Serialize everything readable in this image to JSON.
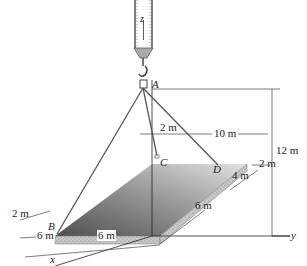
{
  "figure": {
    "points": {
      "A": "A",
      "B": "B",
      "C": "C",
      "D": "D"
    },
    "axes": {
      "x": "x",
      "y": "y",
      "z": "z"
    },
    "dimensions": {
      "height_A": "12 m",
      "c_offset": "2 m",
      "d_offset_top": "10 m",
      "d_side_2": "2 m",
      "d_side_4": "4 m",
      "right_edge_6": "6 m",
      "b_offset": "2 m",
      "front_6_left": "6 m",
      "front_6_right": "6 m"
    },
    "colors": {
      "plate_dark": "#5f5f5f",
      "plate_light": "#d0d0d0",
      "edge_speckle": "#b8b8b8",
      "line": "#333333"
    }
  }
}
